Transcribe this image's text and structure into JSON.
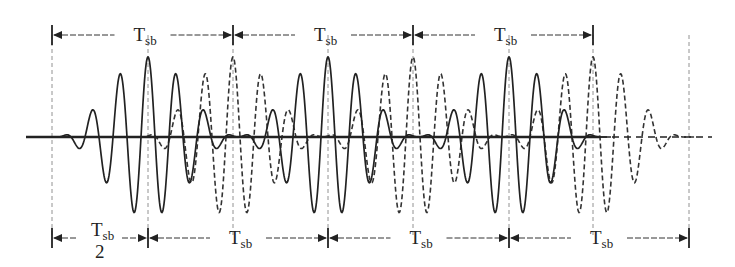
{
  "figure": {
    "colors": {
      "ink": "#222222",
      "guide": "#555555",
      "background": "#ffffff"
    },
    "axis": {
      "y": 137,
      "x_start": 26,
      "x_solid_end": 600,
      "x_dashed_end": 712
    },
    "top_markers": {
      "y": 35,
      "x": [
        52,
        233,
        413,
        593
      ],
      "labels": [
        {
          "main": "T",
          "sub": "sb"
        },
        {
          "main": "T",
          "sub": "sb"
        },
        {
          "main": "T",
          "sub": "sb"
        }
      ]
    },
    "bottom_markers": {
      "y": 238,
      "x": [
        52,
        148,
        328,
        509,
        689
      ],
      "labels": [
        {
          "main": "T",
          "sub": "sb",
          "denominator": "2"
        },
        {
          "main": "T",
          "sub": "sb"
        },
        {
          "main": "T",
          "sub": "sb"
        },
        {
          "main": "T",
          "sub": "sb"
        }
      ]
    },
    "waveforms": {
      "solid": {
        "style": "solid",
        "bursts_center_x": [
          148,
          328,
          509
        ],
        "half_width": 92,
        "period": 28,
        "amplitude": 80
      },
      "dashed": {
        "style": "dashed",
        "bursts_center_x": [
          233,
          413,
          593
        ],
        "half_width": 92,
        "period": 28,
        "amplitude": 80
      }
    }
  }
}
